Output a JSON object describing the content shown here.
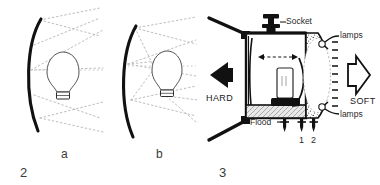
{
  "figure": {
    "title_glyphs": [
      "2",
      "3"
    ],
    "panels": [
      {
        "id": "panel-2a",
        "caption": "a",
        "figure_number": "2",
        "description": "lamp close to reflector, narrow beam spread",
        "reflector": "curved-reflector",
        "bulb": "light-bulb"
      },
      {
        "id": "panel-2b",
        "caption": "b",
        "figure_number": "",
        "description": "lamp far from reflector, wide beam spread",
        "reflector": "curved-reflector",
        "bulb": "light-bulb"
      },
      {
        "id": "panel-3",
        "caption": "",
        "figure_number": "3",
        "description": "cross-section of luminaire housing"
      }
    ],
    "number_2": "2",
    "number_3": "3",
    "caption_a": "a",
    "caption_b": "b"
  },
  "panel3": {
    "socket_label": "Socket",
    "hard_label": "HARD",
    "soft_label": "SOFT",
    "flood_label": "Flood",
    "lamps_label_top": "lamps",
    "lamps_label_bottom": "lamps",
    "contact_1": "1",
    "contact_2": "2",
    "hard_arrow": "solid-left-arrow",
    "soft_arrow": "outline-right-arrow",
    "slide_arrow": "double-headed-horizontal-arrow",
    "rotate_arrow": "curved-arrow"
  },
  "colors": {
    "ink": "#111111",
    "ray": "#b9b9b9",
    "hatch": "#c9c9c9",
    "background": "#ffffff",
    "label": "#2a2a2a"
  }
}
